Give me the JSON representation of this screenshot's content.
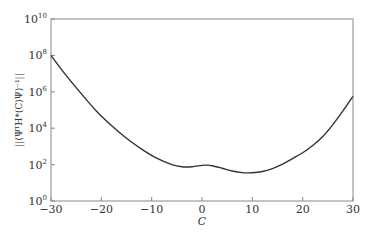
{
  "chart_data": {
    "type": "line",
    "title": "",
    "xlabel": "C",
    "ylabel": "||(ΨᵀH*(C)Ψ)⁻¹||",
    "xlim": [
      -30,
      30
    ],
    "ylim_log10": [
      0,
      10
    ],
    "yscale": "log",
    "grid": false,
    "legend": "none",
    "x_ticks": [
      -30,
      -20,
      -10,
      0,
      10,
      20,
      30
    ],
    "x_tick_labels": [
      "−30",
      "−20",
      "−10",
      "0",
      "10",
      "20",
      "30"
    ],
    "y_ticks_log10": [
      0,
      2,
      4,
      6,
      8,
      10
    ],
    "y_tick_labels": [
      {
        "base": "10",
        "exp": "0"
      },
      {
        "base": "10",
        "exp": "2"
      },
      {
        "base": "10",
        "exp": "4"
      },
      {
        "base": "10",
        "exp": "6"
      },
      {
        "base": "10",
        "exp": "8"
      },
      {
        "base": "10",
        "exp": "10"
      }
    ],
    "series": [
      {
        "name": "norm",
        "color": "#333333",
        "x": [
          -30,
          -27,
          -24,
          -21,
          -18,
          -15,
          -12,
          -9,
          -6,
          -4,
          -2,
          0,
          1,
          2,
          4,
          6,
          8,
          10,
          12,
          14,
          16,
          18,
          20,
          22,
          24,
          26,
          28,
          30
        ],
        "log10_y": [
          8.0,
          6.9,
          5.9,
          4.95,
          4.15,
          3.45,
          2.85,
          2.35,
          2.0,
          1.88,
          1.88,
          1.96,
          1.97,
          1.94,
          1.8,
          1.65,
          1.56,
          1.55,
          1.62,
          1.78,
          2.02,
          2.33,
          2.65,
          3.05,
          3.55,
          4.2,
          4.95,
          5.75
        ]
      }
    ]
  }
}
